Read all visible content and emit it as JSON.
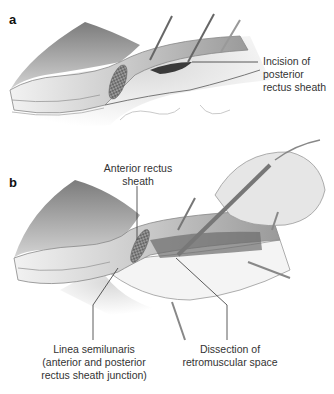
{
  "figure": {
    "panels": [
      {
        "letter": "a",
        "labels": [
          {
            "id": "incision",
            "lines": [
              "Incision of",
              "posterior",
              "rectus sheath"
            ]
          }
        ]
      },
      {
        "letter": "b",
        "labels": [
          {
            "id": "anterior",
            "lines": [
              "Anterior rectus",
              "sheath"
            ]
          },
          {
            "id": "linea",
            "lines": [
              "Linea semilunaris",
              "(anterior and posterior",
              "rectus sheath junction)"
            ]
          },
          {
            "id": "dissection",
            "lines": [
              "Dissection of",
              "retromuscular space"
            ]
          }
        ]
      }
    ]
  },
  "colors": {
    "background": "#ffffff",
    "tissue_dark": "#8a8a8a",
    "tissue_mid": "#b8b8b8",
    "tissue_light": "#dcdcdc",
    "leader_line": "#333333"
  }
}
